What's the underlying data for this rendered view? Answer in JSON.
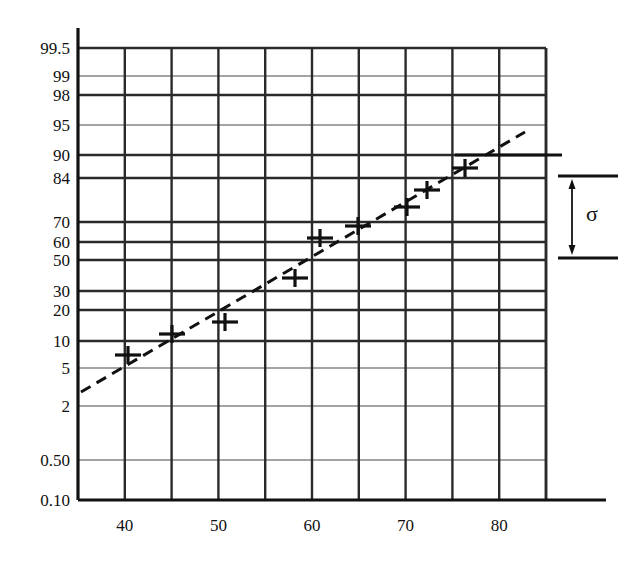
{
  "chart_data": {
    "type": "scatter",
    "title": "",
    "subtitle": "",
    "xlabel": "",
    "ylabel": "",
    "grid": true,
    "legend": null,
    "plot_area_px": {
      "left": 78,
      "right": 546,
      "top": 48,
      "bottom": 500
    },
    "x_axis": {
      "min": 35,
      "max": 85,
      "major_ticks": [
        40,
        50,
        60,
        70,
        80
      ],
      "major_tick_labels": [
        "40",
        "50",
        "60",
        "70",
        "80"
      ],
      "minor_ticks": [
        45,
        55,
        65,
        75,
        85
      ],
      "scale": "linear"
    },
    "y_axis": {
      "scale": "normal-probability",
      "units": "percent",
      "tick_labels": [
        "99.5",
        "99",
        "98",
        "95",
        "90",
        "84",
        "70",
        "60",
        "50",
        "30",
        "20",
        "10",
        "5",
        "2",
        "0.50",
        "0.10"
      ],
      "tick_values": [
        99.5,
        99,
        98,
        95,
        90,
        84,
        70,
        60,
        50,
        30,
        20,
        10,
        5,
        2,
        0.5,
        0.1
      ],
      "tick_pixels": [
        48,
        76,
        95,
        125,
        155,
        178,
        222,
        242,
        260,
        291,
        310,
        341,
        368,
        406,
        460,
        500
      ],
      "major_gridlines": [
        99.5,
        98,
        90,
        84,
        70,
        60,
        50,
        30,
        20,
        10
      ],
      "minor_gridlines": [
        99,
        95,
        5,
        2,
        0.5,
        0.1
      ]
    },
    "series": [
      {
        "name": "Data",
        "marker": "plus",
        "points": [
          {
            "x": 39.5,
            "y_percent": 12.5,
            "px": 128,
            "py": 355
          },
          {
            "x": 44.3,
            "y_percent": 20.5,
            "px": 172,
            "py": 334
          },
          {
            "x": 50.0,
            "y_percent": 24.5,
            "px": 225,
            "py": 322
          },
          {
            "x": 57.5,
            "y_percent": 42.0,
            "px": 295,
            "py": 278
          },
          {
            "x": 60.5,
            "y_percent": 58.0,
            "px": 320,
            "py": 238
          },
          {
            "x": 64.5,
            "y_percent": 66.0,
            "px": 358,
            "py": 226
          },
          {
            "x": 70.0,
            "y_percent": 73.0,
            "px": 407,
            "py": 207
          },
          {
            "x": 72.5,
            "y_percent": 79.0,
            "px": 427,
            "py": 190
          },
          {
            "x": 76.5,
            "y_percent": 88.0,
            "px": 465,
            "py": 168
          }
        ]
      }
    ],
    "fit_line": {
      "name": "Fitted line",
      "style": "dashed",
      "x_start": 35.3,
      "y_start_percent": 4.6,
      "x_end": 83.5,
      "y_end_percent": 94.0,
      "px_start": 81,
      "py_start": 392,
      "px_end": 525,
      "py_end": 132
    },
    "annotations": [
      {
        "name": "sigma-bracket",
        "label": "σ",
        "description": "Double-headed arrow spanning from the 84% level to the 50% level, marking one standard deviation",
        "from_percent": 84,
        "to_percent": 50,
        "top_px": 176,
        "bottom_px": 258,
        "label_px": 592,
        "label_py": 214
      },
      {
        "name": "mean-reference-line",
        "description": "Horizontal reference line extending right from the plot at the 90 gridline level",
        "y_percent": 90,
        "py": 155
      }
    ]
  },
  "style": {
    "line_color": "#111111",
    "grid_color": "#2a2a2a",
    "minor_grid_color": "#4a4a4a",
    "background": "#ffffff"
  },
  "sigma": {
    "symbol": "σ"
  }
}
